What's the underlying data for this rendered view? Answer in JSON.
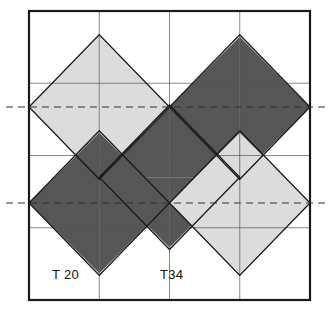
{
  "figure": {
    "background_color": "#ffffff",
    "frame": {
      "name": "outer-square-frame",
      "x": 29,
      "y": 11,
      "width": 281,
      "height": 289,
      "stroke_color": "#1a1a1a",
      "stroke_width": 2.2,
      "fill": "none"
    },
    "grid": {
      "cell_size_x": 70.25,
      "cell_size_y": 72.25,
      "columns": 4,
      "rows": 4,
      "stroke_color": "#4a4a4a",
      "stroke_width": 0.7,
      "x_lines": [
        29,
        99.25,
        169.5,
        239.75,
        310
      ],
      "y_lines": [
        11,
        83.25,
        155.5,
        227.75,
        300
      ]
    },
    "colors": {
      "light_fill": "#dcdcdc",
      "dark_fill": "#565656",
      "white_fill": "#ffffff",
      "outline": "#1a1a1a",
      "grid_line": "#555555",
      "dashed_line": "#333333",
      "text": "#111111"
    },
    "dashed_reference_lines": [
      {
        "name": "dashed-reference-line-upper",
        "y": 107,
        "x_start": 6,
        "x_end": 330,
        "dash_pattern": "7 5",
        "stroke_width": 1.2
      },
      {
        "name": "dashed-reference-line-lower",
        "y": 203,
        "x_start": 6,
        "x_end": 330,
        "dash_pattern": "7 5",
        "stroke_width": 1.2
      }
    ],
    "labels": [
      {
        "name": "tile-label-t20",
        "text": "T 20",
        "x": 52,
        "y": 279
      },
      {
        "name": "tile-label-t34",
        "text": "T34",
        "x": 160,
        "y": 279
      }
    ],
    "triangles": [
      {
        "id": "tri-01",
        "points": "29,107 99.25,36.75 99.25,107",
        "fill": "light"
      },
      {
        "id": "tri-02",
        "points": "99.25,36.75 169.5,107 99.25,107",
        "fill": "light"
      },
      {
        "id": "tri-03",
        "points": "29,107 99.25,107 99.25,177.25",
        "fill": "light"
      },
      {
        "id": "tri-04",
        "points": "99.25,107 169.5,107 99.25,177.25",
        "fill": "light"
      },
      {
        "id": "tri-05",
        "points": "169.5,107 239.75,36.75 239.75,107",
        "fill": "dark"
      },
      {
        "id": "tri-06",
        "points": "239.75,36.75 310,107 239.75,107",
        "fill": "dark"
      },
      {
        "id": "tri-07",
        "points": "169.5,107 239.75,107 239.75,177.25",
        "fill": "dark"
      },
      {
        "id": "tri-08",
        "points": "239.75,107 310,107 239.75,177.25",
        "fill": "dark"
      },
      {
        "id": "tri-09",
        "points": "99.25,177.25 169.5,107 169.5,177.25",
        "fill": "dark"
      },
      {
        "id": "tri-10",
        "points": "169.5,107 239.75,177.25 169.5,177.25",
        "fill": "dark"
      },
      {
        "id": "tri-11",
        "points": "99.25,177.25 169.5,177.25 169.5,247.5",
        "fill": "dark"
      },
      {
        "id": "tri-12",
        "points": "169.5,177.25 239.75,177.25 169.5,247.5",
        "fill": "dark"
      },
      {
        "id": "tri-13",
        "points": "29,203 99.25,132.75 99.25,203",
        "fill": "dark"
      },
      {
        "id": "tri-14",
        "points": "99.25,132.75 169.5,203 99.25,203",
        "fill": "dark"
      },
      {
        "id": "tri-15",
        "points": "29,203 99.25,203 99.25,273.25",
        "fill": "dark"
      },
      {
        "id": "tri-16",
        "points": "99.25,203 169.5,203 99.25,273.25",
        "fill": "dark"
      },
      {
        "id": "tri-17",
        "points": "169.5,203 239.75,132.75 239.75,203",
        "fill": "light"
      },
      {
        "id": "tri-18",
        "points": "239.75,132.75 310,203 239.75,203",
        "fill": "light"
      },
      {
        "id": "tri-19",
        "points": "169.5,203 239.75,203 239.75,273.25",
        "fill": "light"
      },
      {
        "id": "tri-20",
        "points": "239.75,203 310,203 239.75,273.25",
        "fill": "light"
      }
    ]
  }
}
